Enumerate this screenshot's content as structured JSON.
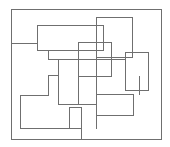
{
  "diagram": {
    "type": "overlapping-rectilinear-shapes",
    "width": 170,
    "height": 147,
    "background": "#ffffff",
    "stroke_color": "#6f6f6f",
    "stroke_width": 1,
    "shapes": [
      {
        "name": "outer-frame",
        "kind": "rect",
        "x": 11,
        "y": 9,
        "w": 150,
        "h": 130
      },
      {
        "name": "top-left-stepped-path",
        "kind": "polyline",
        "points": "11,43 37,43 37,25 103,25"
      },
      {
        "name": "upper-step-path",
        "kind": "polyline",
        "points": "37,43 37,50 48,50 48,59 58,59"
      },
      {
        "name": "center-horizontal-59",
        "kind": "polyline",
        "points": "48,59 125,59"
      },
      {
        "name": "center-horizontal-50",
        "kind": "polyline",
        "points": "37,50 103,50 103,25"
      },
      {
        "name": "large-right-rect",
        "kind": "rect",
        "x": 96,
        "y": 17,
        "w": 36,
        "h": 40
      },
      {
        "name": "center-square",
        "kind": "rect",
        "x": 78,
        "y": 42,
        "w": 33,
        "h": 34
      },
      {
        "name": "right-small-rect",
        "kind": "rect",
        "x": 125,
        "y": 52,
        "w": 23,
        "h": 38
      },
      {
        "name": "center-vertical-58",
        "kind": "polyline",
        "points": "58,59 58,104"
      },
      {
        "name": "center-vertical-78",
        "kind": "polyline",
        "points": "78,76 78,104"
      },
      {
        "name": "lower-left-l-path",
        "kind": "polyline",
        "points": "58,75 48,75 48,95 20,95 20,128 81,128"
      },
      {
        "name": "lower-middle-rect",
        "kind": "rect",
        "x": 69,
        "y": 107,
        "w": 12,
        "h": 21
      },
      {
        "name": "lower-horizontal-104",
        "kind": "polyline",
        "points": "58,104 96,104"
      },
      {
        "name": "lower-right-rect",
        "kind": "rect",
        "x": 96,
        "y": 94,
        "w": 37,
        "h": 21
      },
      {
        "name": "lower-vertical-81",
        "kind": "polyline",
        "points": "81,107 81,139"
      },
      {
        "name": "long-vertical-96",
        "kind": "polyline",
        "points": "96,42 96,128"
      },
      {
        "name": "connector-104-to-139",
        "kind": "polyline",
        "points": "139,76 139,94"
      }
    ]
  }
}
